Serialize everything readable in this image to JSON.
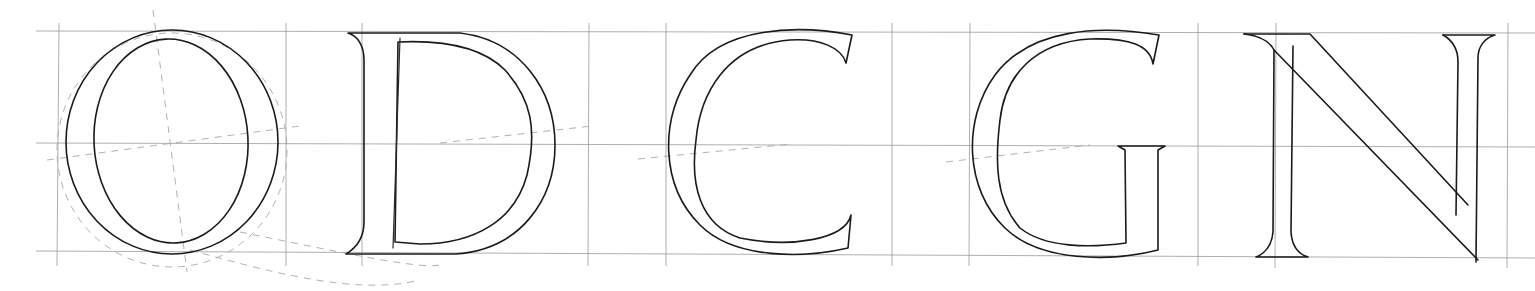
{
  "drawing": {
    "subject": "Letter construction sketch",
    "letters": [
      "O",
      "D",
      "C",
      "G",
      "N"
    ],
    "colors": {
      "background": "#ffffff",
      "ink": "#1a1a1a",
      "grid": "#9a9a9a",
      "guides": "#a8a8a8"
    },
    "grid": {
      "horizontal_lines_y": [
        31,
        143,
        253
      ],
      "vertical_lines_x": [
        58,
        286,
        362,
        589,
        666,
        892,
        969,
        1198,
        1275,
        1508
      ]
    }
  }
}
